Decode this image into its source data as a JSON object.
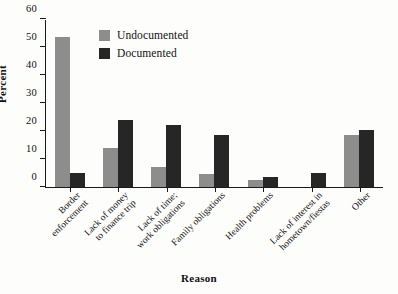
{
  "chart_data": {
    "type": "bar",
    "title": "",
    "xlabel": "Reason",
    "ylabel": "Percent",
    "ylim": [
      0,
      60
    ],
    "yticks": [
      0,
      10,
      20,
      30,
      40,
      50,
      60
    ],
    "grid": false,
    "legend_position": "top-center",
    "categories": [
      "Border enforcement",
      "Lack of money to finance trip",
      "Lack of time; work obligations",
      "Family obligations",
      "Health problems",
      "Lack of interest in hometown/fiestas",
      "Other"
    ],
    "category_lines": [
      [
        "Border",
        "enforcement"
      ],
      [
        "Lack of money",
        "to finance trip"
      ],
      [
        "Lack of time;",
        "work obligations"
      ],
      [
        "Family obligations"
      ],
      [
        "Health problems"
      ],
      [
        "Lack of interest in",
        "hometown/fiestas"
      ],
      [
        "Other"
      ]
    ],
    "series": [
      {
        "name": "Undocumented",
        "color": "#8d8d8d",
        "values": [
          53.5,
          14.0,
          7.0,
          4.5,
          2.5,
          0,
          18.5
        ]
      },
      {
        "name": "Documented",
        "color": "#262626",
        "values": [
          5.0,
          24.0,
          22.0,
          18.5,
          3.5,
          5.0,
          20.5
        ]
      }
    ]
  },
  "axis": {
    "y_title": "Percent",
    "x_title": "Reason",
    "y_tick_labels": [
      "60",
      "50",
      "40",
      "30",
      "20",
      "10",
      "0"
    ]
  },
  "legend": {
    "items": [
      {
        "label": "Undocumented",
        "color": "#8d8d8d"
      },
      {
        "label": "Documented",
        "color": "#262626"
      }
    ]
  }
}
